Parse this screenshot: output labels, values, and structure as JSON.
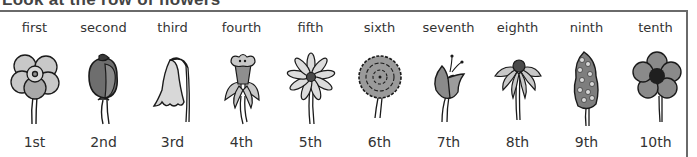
{
  "heading": "Look at the row of flowers",
  "colors": {
    "border": "#6a6a6a",
    "stroke": "#1a1a1a",
    "light": "#c8c8c8",
    "mid": "#8f8f8f",
    "dark": "#5c5c5c"
  },
  "flowers": [
    {
      "word": "first",
      "number": "1st",
      "icon": "carnation-icon"
    },
    {
      "word": "second",
      "number": "2nd",
      "icon": "rose-icon"
    },
    {
      "word": "third",
      "number": "3rd",
      "icon": "bellflower-icon"
    },
    {
      "word": "fourth",
      "number": "4th",
      "icon": "daffodil-icon"
    },
    {
      "word": "fifth",
      "number": "5th",
      "icon": "daisy-icon"
    },
    {
      "word": "sixth",
      "number": "6th",
      "icon": "marigold-icon"
    },
    {
      "word": "seventh",
      "number": "7th",
      "icon": "tulip-icon"
    },
    {
      "word": "eighth",
      "number": "8th",
      "icon": "coneflower-icon"
    },
    {
      "word": "ninth",
      "number": "9th",
      "icon": "lilac-icon"
    },
    {
      "word": "tenth",
      "number": "10th",
      "icon": "buttercup-icon"
    }
  ]
}
